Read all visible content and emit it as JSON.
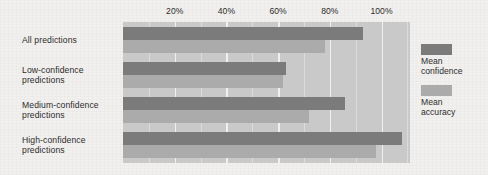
{
  "chart_data": {
    "type": "bar",
    "orientation": "horizontal",
    "title": "",
    "xlabel": "",
    "ylabel": "",
    "categories": [
      "All predictions",
      "Low-confidence predictions",
      "Medium-confidence predictions",
      "High-confidence predictions"
    ],
    "category_lines": [
      [
        "All predictions"
      ],
      [
        "Low-confidence",
        "predictions"
      ],
      [
        "Medium-confidence",
        "predictions"
      ],
      [
        "High-confidence",
        "predictions"
      ]
    ],
    "series": [
      {
        "name": "Mean confidence",
        "color": "#7b7b7b",
        "values": [
          93,
          63,
          86,
          108
        ]
      },
      {
        "name": "Mean accuracy",
        "color": "#ababab",
        "values": [
          78,
          62,
          72,
          98
        ]
      }
    ],
    "xlim": [
      0,
      111
    ],
    "tick_values": [
      20,
      40,
      60,
      80,
      100
    ],
    "tick_labels": [
      "20%",
      "40%",
      "60%",
      "80%",
      "100%"
    ],
    "minor_tick_values": [
      10,
      30,
      50,
      70,
      90,
      110
    ],
    "grid": true,
    "legend_position": "right",
    "legend_entries": [
      {
        "label_lines": [
          "Mean",
          "confidence"
        ],
        "color": "#7b7b7b"
      },
      {
        "label_lines": [
          "Mean",
          "accuracy"
        ],
        "color": "#ababab"
      }
    ],
    "colors": {
      "plot_background": "#c9c9c9",
      "page_background": "#f1f0ee",
      "gridline": "#dcdcdc",
      "gridline_major": "#f0f0f0",
      "text": "#2c2c2c"
    }
  }
}
